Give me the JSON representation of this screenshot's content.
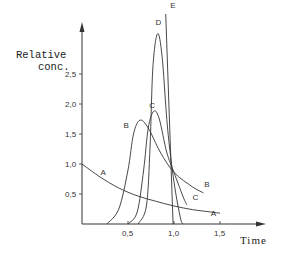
{
  "chart_data": {
    "type": "line",
    "title": "",
    "xlabel": "Time",
    "ylabel": "Relative conc.",
    "xlim": [
      0,
      1.85
    ],
    "ylim": [
      0,
      3.4
    ],
    "grid": false,
    "legend": "inline labels on curves",
    "x_ticks": [
      "0,5",
      "1,0",
      "1,5"
    ],
    "y_ticks": [
      "0,5",
      "1,0",
      "1,5",
      "2,0",
      "2,5"
    ],
    "x_tick_values": [
      0.5,
      1.0,
      1.5
    ],
    "y_tick_values": [
      0.5,
      1.0,
      1.5,
      2.0,
      2.5
    ],
    "series": [
      {
        "name": "A",
        "x": [
          0,
          0.2,
          0.4,
          0.6,
          0.8,
          1.0,
          1.2,
          1.4,
          1.5
        ],
        "y": [
          1.0,
          0.78,
          0.6,
          0.47,
          0.38,
          0.3,
          0.24,
          0.2,
          0.18
        ]
      },
      {
        "name": "B",
        "x": [
          0.27,
          0.4,
          0.5,
          0.56,
          0.63,
          0.72,
          0.85,
          1.0,
          1.2,
          1.32
        ],
        "y": [
          0,
          0.25,
          0.9,
          1.5,
          1.73,
          1.6,
          1.2,
          0.86,
          0.62,
          0.52
        ]
      },
      {
        "name": "C",
        "x": [
          0.5,
          0.6,
          0.67,
          0.72,
          0.78,
          0.84,
          0.92,
          1.0,
          1.1,
          1.14
        ],
        "y": [
          0,
          0.2,
          0.9,
          1.6,
          1.88,
          1.75,
          1.2,
          0.86,
          0.45,
          0.32
        ]
      },
      {
        "name": "D",
        "x": [
          0.61,
          0.7,
          0.74,
          0.77,
          0.82,
          0.87,
          0.93,
          1.0,
          1.07,
          1.1
        ],
        "y": [
          0,
          0.3,
          1.3,
          2.6,
          3.17,
          2.8,
          1.6,
          0.7,
          0.1,
          0
        ]
      },
      {
        "name": "E",
        "x": [
          0.91,
          0.99
        ],
        "y": [
          3.5,
          0
        ]
      }
    ],
    "curve_labels": [
      {
        "text": "A",
        "x": 0.2,
        "y": 0.82
      },
      {
        "text": "A",
        "x": 1.4,
        "y": 0.14
      },
      {
        "text": "B",
        "x": 0.45,
        "y": 1.6
      },
      {
        "text": "B",
        "x": 1.33,
        "y": 0.62
      },
      {
        "text": "C",
        "x": 0.73,
        "y": 1.93
      },
      {
        "text": "C",
        "x": 1.2,
        "y": 0.4
      },
      {
        "text": "D",
        "x": 0.8,
        "y": 3.32
      },
      {
        "text": "E",
        "x": 0.96,
        "y": 3.6
      }
    ]
  },
  "labels": {
    "y_axis_line1": "Relative",
    "y_axis_line2": "conc.",
    "x_axis": "Time"
  }
}
